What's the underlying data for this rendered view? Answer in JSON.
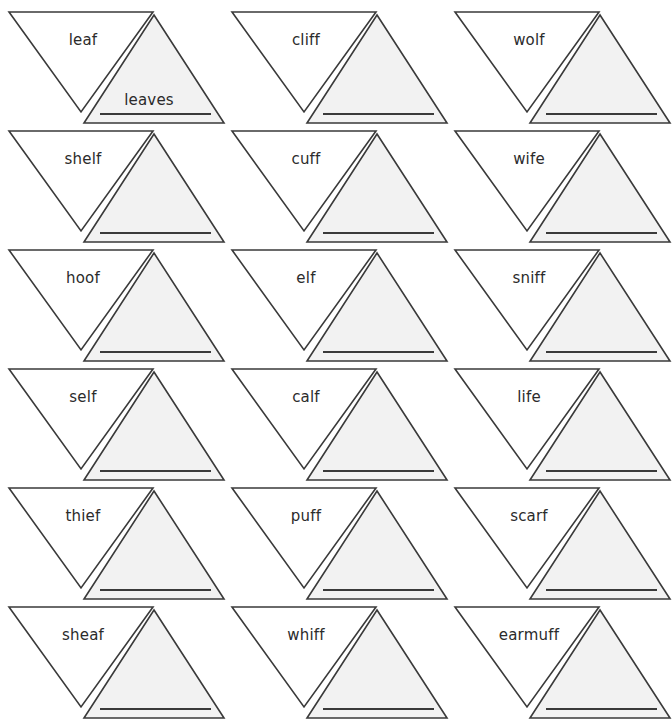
{
  "page": {
    "background_color": "#ffffff",
    "stroke_color": "#3a3a3a",
    "shaded_fill": "#f2f2f2",
    "unshaded_fill": "#ffffff",
    "text_color": "#2b2b2b",
    "columns": 3,
    "rows": 6
  },
  "legend": {
    "singular_shape": "downward-triangle",
    "plural_shape": "upward-triangle-shaded",
    "plural_write_line": "blank ruled line for student answer"
  },
  "cells": [
    {
      "singular": "leaf",
      "plural": "leaves",
      "filled": true
    },
    {
      "singular": "cliff",
      "plural": "",
      "filled": false
    },
    {
      "singular": "wolf",
      "plural": "",
      "filled": false
    },
    {
      "singular": "shelf",
      "plural": "",
      "filled": false
    },
    {
      "singular": "cuff",
      "plural": "",
      "filled": false
    },
    {
      "singular": "wife",
      "plural": "",
      "filled": false
    },
    {
      "singular": "hoof",
      "plural": "",
      "filled": false
    },
    {
      "singular": "elf",
      "plural": "",
      "filled": false
    },
    {
      "singular": "sniff",
      "plural": "",
      "filled": false
    },
    {
      "singular": "self",
      "plural": "",
      "filled": false
    },
    {
      "singular": "calf",
      "plural": "",
      "filled": false
    },
    {
      "singular": "life",
      "plural": "",
      "filled": false
    },
    {
      "singular": "thief",
      "plural": "",
      "filled": false
    },
    {
      "singular": "puff",
      "plural": "",
      "filled": false
    },
    {
      "singular": "scarf",
      "plural": "",
      "filled": false
    },
    {
      "singular": "sheaf",
      "plural": "",
      "filled": false
    },
    {
      "singular": "whiff",
      "plural": "",
      "filled": false
    },
    {
      "singular": "earmuff",
      "plural": "",
      "filled": false
    }
  ],
  "layout": {
    "origin_x": 8,
    "origin_y": 11,
    "col_pitch": 223,
    "row_pitch": 119
  }
}
